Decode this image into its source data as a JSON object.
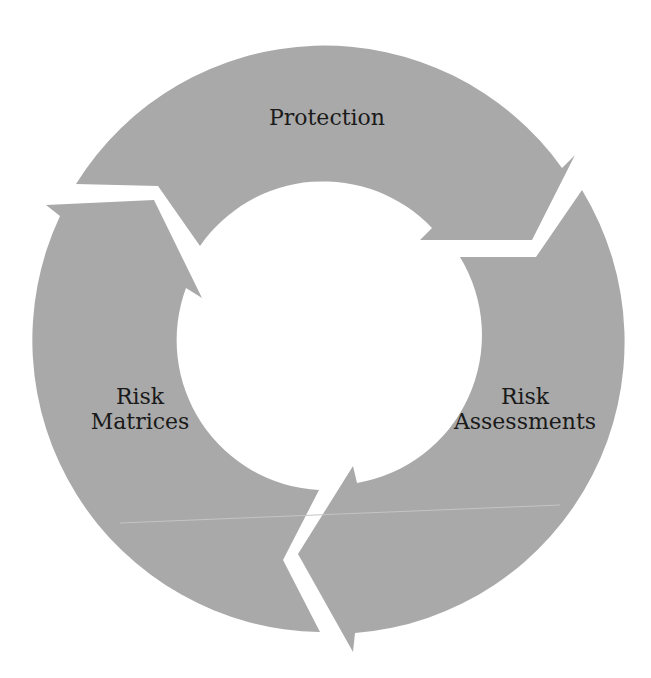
{
  "diagram": {
    "type": "cycle",
    "fill_color": "#a9a9a9",
    "background_color": "#ffffff",
    "text_color": "#1a1a1a",
    "direction": "clockwise",
    "steps": [
      {
        "id": "protection",
        "line1": "Protection",
        "line2": ""
      },
      {
        "id": "risk-assessments",
        "line1": "Risk",
        "line2": "Assessments"
      },
      {
        "id": "risk-matrices",
        "line1": "Risk",
        "line2": "Matrices"
      }
    ]
  }
}
